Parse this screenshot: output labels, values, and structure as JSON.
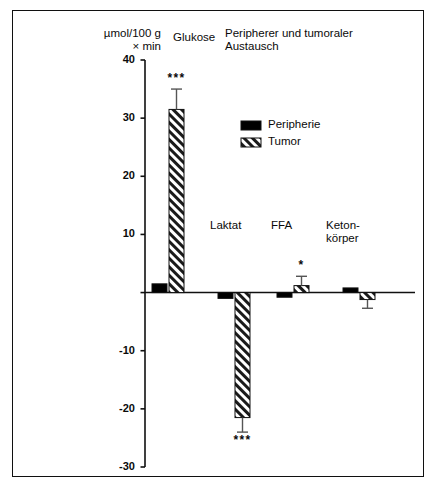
{
  "figure": {
    "title": "Peripherer und tumoraler\nAustausch",
    "axis_unit_label": "µmol/100 g\n× min",
    "background_color": "#ffffff",
    "frame_color": "#101010",
    "ink_color": "#0a0a0a"
  },
  "legend": {
    "position": "upper-center-right",
    "entries": [
      {
        "label": "Peripherie",
        "fill": "solid-black",
        "color": "#000000"
      },
      {
        "label": "Tumor",
        "fill": "diagonal-hatch",
        "color": "#000000"
      }
    ]
  },
  "chart_data": {
    "type": "bar",
    "title": "Peripherer und tumoraler Austausch",
    "xlabel": "",
    "ylabel": "µmol/100 g × min",
    "ylim": [
      -30,
      40
    ],
    "yticks": [
      40,
      30,
      20,
      10,
      0,
      -10,
      -20,
      -30
    ],
    "ytick_labels": [
      "40",
      "30",
      "20",
      "10",
      "",
      "-10",
      "-20",
      "-30"
    ],
    "grid": false,
    "zero_line": true,
    "categories": [
      "Glukose",
      "Laktat",
      "FFA",
      "Keton-\nkörper"
    ],
    "category_labels_plain": [
      "Glukose",
      "Laktat",
      "FFA",
      "Ketonkörper"
    ],
    "series": [
      {
        "name": "Peripherie",
        "fill": "solid",
        "values": [
          1.5,
          -1.0,
          -0.8,
          0.8
        ],
        "errors": [
          0,
          0,
          0,
          0
        ],
        "significance": [
          "",
          "",
          "",
          ""
        ]
      },
      {
        "name": "Tumor",
        "fill": "hatch",
        "values": [
          31.5,
          -21.5,
          1.2,
          -1.2
        ],
        "errors": [
          3.5,
          2.5,
          1.6,
          1.5
        ],
        "significance": [
          "***",
          "***",
          "*",
          ""
        ]
      }
    ],
    "annotations": [
      {
        "text": "***",
        "series": "Tumor",
        "category": "Glukose",
        "placement": "above-error-bar"
      },
      {
        "text": "***",
        "series": "Tumor",
        "category": "Laktat",
        "placement": "below-error-bar"
      },
      {
        "text": "*",
        "series": "Tumor",
        "category": "FFA",
        "placement": "above-error-bar"
      }
    ]
  }
}
